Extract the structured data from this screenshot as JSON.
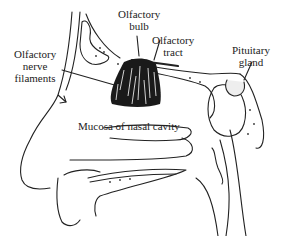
{
  "diagram": {
    "labels": {
      "olfactory_bulb": [
        "Olfactory",
        "bulb"
      ],
      "olfactory_tract": [
        "Olfactory",
        "tract"
      ],
      "olfactory_nerve_filaments": [
        "Olfactory",
        "nerve",
        "filaments"
      ],
      "pituitary_gland": [
        "Pituitary",
        "gland"
      ],
      "mucosa": "Mucosa of nasal cavity"
    },
    "colors": {
      "line": "#222222",
      "background": "#ffffff"
    }
  }
}
